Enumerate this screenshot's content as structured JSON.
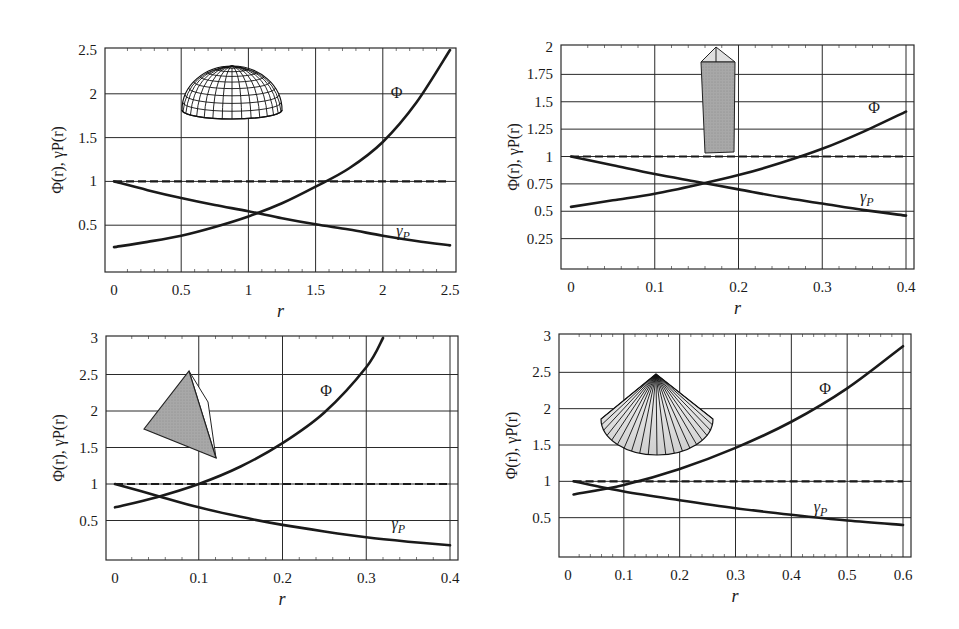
{
  "figure": {
    "width": 959,
    "height": 629
  },
  "chart_data": [
    {
      "type": "line",
      "panel": "top-left",
      "shape": "hemisphere-wireframe",
      "title": "",
      "xlabel": "r",
      "ylabel": "Φ(r), γP(r)",
      "xlim": [
        0,
        2.5
      ],
      "ylim": [
        0,
        2.5
      ],
      "xticks": [
        0,
        0.5,
        1,
        1.5,
        2,
        2.5
      ],
      "xtick_labels": [
        "0",
        "0.5",
        "1",
        "1.5",
        "2",
        "2.5"
      ],
      "yticks": [
        0.5,
        1,
        1.5,
        2,
        2.5
      ],
      "ytick_labels": [
        "0.5",
        "1",
        "1.5",
        "2",
        "2.5"
      ],
      "grid": true,
      "frame": {
        "left": 105,
        "top": 48,
        "right": 456,
        "bottom": 272,
        "x0px": 114,
        "x1px": 450
      },
      "series": [
        {
          "name": "Φ",
          "style": "solid",
          "x": [
            0,
            0.25,
            0.5,
            0.75,
            1.0,
            1.25,
            1.5,
            1.75,
            2.0,
            2.25,
            2.5
          ],
          "y": [
            0.25,
            0.31,
            0.38,
            0.48,
            0.6,
            0.75,
            0.94,
            1.15,
            1.45,
            1.9,
            2.5
          ]
        },
        {
          "name": "γP",
          "style": "solid",
          "x": [
            0,
            0.25,
            0.5,
            0.75,
            1.0,
            1.25,
            1.5,
            1.75,
            2.0,
            2.25,
            2.5
          ],
          "y": [
            1.0,
            0.9,
            0.81,
            0.73,
            0.66,
            0.58,
            0.51,
            0.45,
            0.38,
            0.32,
            0.27
          ]
        },
        {
          "name": "reference",
          "style": "dashed",
          "x": [
            0,
            2.5
          ],
          "y": [
            1.0,
            1.0
          ]
        }
      ],
      "annotations": [
        {
          "text": "Φ",
          "x": 2.06,
          "y": 1.95
        },
        {
          "text": "γP",
          "x": 2.1,
          "y": 0.38
        }
      ]
    },
    {
      "type": "line",
      "panel": "top-right",
      "shape": "prism-column",
      "title": "",
      "xlabel": "r",
      "ylabel": "Φ(r),  γP(r)",
      "xlim": [
        0,
        0.4
      ],
      "ylim": [
        0,
        2
      ],
      "xticks": [
        0,
        0.1,
        0.2,
        0.3,
        0.4
      ],
      "xtick_labels": [
        "0",
        "0.1",
        "0.2",
        "0.3",
        "0.4"
      ],
      "yticks": [
        0.25,
        0.5,
        0.75,
        1,
        1.25,
        1.5,
        1.75,
        2
      ],
      "ytick_labels": [
        "0.25",
        "0.5",
        "0.75",
        "1",
        "1.25",
        "1.5",
        "1.75",
        "2"
      ],
      "grid": true,
      "frame": {
        "left": 561,
        "top": 45,
        "right": 914,
        "bottom": 269,
        "x0px": 571,
        "x1px": 906
      },
      "series": [
        {
          "name": "Φ",
          "style": "solid",
          "x": [
            0,
            0.05,
            0.1,
            0.15,
            0.2,
            0.25,
            0.3,
            0.35,
            0.4
          ],
          "y": [
            0.54,
            0.6,
            0.66,
            0.74,
            0.83,
            0.94,
            1.07,
            1.23,
            1.41
          ]
        },
        {
          "name": "γP",
          "style": "solid",
          "x": [
            0,
            0.05,
            0.1,
            0.15,
            0.2,
            0.25,
            0.3,
            0.35,
            0.4
          ],
          "y": [
            1.0,
            0.92,
            0.84,
            0.77,
            0.7,
            0.63,
            0.57,
            0.51,
            0.46
          ]
        },
        {
          "name": "reference",
          "style": "dashed",
          "x": [
            0,
            0.4
          ],
          "y": [
            1.0,
            1.0
          ]
        }
      ],
      "annotations": [
        {
          "text": "Φ",
          "x": 0.355,
          "y": 1.4
        },
        {
          "text": "γP",
          "x": 0.345,
          "y": 0.58
        }
      ]
    },
    {
      "type": "line",
      "panel": "bottom-left",
      "shape": "tetrahedron",
      "title": "",
      "xlabel": "r",
      "ylabel": "Φ(r), γP(r)",
      "xlim": [
        0,
        0.4
      ],
      "ylim": [
        0,
        3
      ],
      "xticks": [
        0,
        0.1,
        0.2,
        0.3,
        0.4
      ],
      "xtick_labels": [
        "0",
        "0.1",
        "0.2",
        "0.3",
        "0.4"
      ],
      "yticks": [
        0.5,
        1,
        1.5,
        2,
        2.5,
        3
      ],
      "ytick_labels": [
        "0.5",
        "1",
        "1.5",
        "2",
        "2.5",
        "3"
      ],
      "grid": true,
      "frame": {
        "left": 106,
        "top": 336,
        "right": 458,
        "bottom": 560,
        "x0px": 115,
        "x1px": 450
      },
      "series": [
        {
          "name": "Φ",
          "style": "solid",
          "x": [
            0,
            0.05,
            0.1,
            0.15,
            0.2,
            0.25,
            0.3,
            0.32
          ],
          "y": [
            0.68,
            0.82,
            1.0,
            1.24,
            1.56,
            1.98,
            2.6,
            3.0
          ]
        },
        {
          "name": "γP",
          "style": "solid",
          "x": [
            0,
            0.05,
            0.1,
            0.15,
            0.2,
            0.25,
            0.3,
            0.35,
            0.4
          ],
          "y": [
            1.0,
            0.84,
            0.68,
            0.55,
            0.44,
            0.35,
            0.27,
            0.21,
            0.16
          ]
        },
        {
          "name": "reference",
          "style": "dashed",
          "x": [
            0,
            0.4
          ],
          "y": [
            1.0,
            1.0
          ]
        }
      ],
      "annotations": [
        {
          "text": "Φ",
          "x": 0.245,
          "y": 2.2
        },
        {
          "text": "γP",
          "x": 0.33,
          "y": 0.38
        }
      ]
    },
    {
      "type": "line",
      "panel": "bottom-right",
      "shape": "cone",
      "title": "",
      "xlabel": "r",
      "ylabel": "Φ(r), γP(r)",
      "xlim": [
        0,
        0.6
      ],
      "ylim": [
        0,
        3
      ],
      "xticks": [
        0,
        0.1,
        0.2,
        0.3,
        0.4,
        0.5,
        0.6
      ],
      "xtick_labels": [
        "0",
        "0.1",
        "0.2",
        "0.3",
        "0.4",
        "0.5",
        "0.6"
      ],
      "yticks": [
        0.5,
        1,
        1.5,
        2,
        2.5,
        3
      ],
      "ytick_labels": [
        "0.5",
        "1",
        "1.5",
        "2",
        "2.5",
        "3"
      ],
      "grid": true,
      "frame": {
        "left": 559,
        "top": 334,
        "right": 911,
        "bottom": 557,
        "x0px": 568,
        "x1px": 903
      },
      "series": [
        {
          "name": "Φ",
          "style": "solid",
          "x": [
            0.01,
            0.1,
            0.2,
            0.3,
            0.4,
            0.5,
            0.6
          ],
          "y": [
            0.82,
            0.95,
            1.17,
            1.46,
            1.82,
            2.28,
            2.86
          ]
        },
        {
          "name": "γP",
          "style": "solid",
          "x": [
            0.01,
            0.1,
            0.2,
            0.3,
            0.4,
            0.5,
            0.6
          ],
          "y": [
            1.0,
            0.86,
            0.74,
            0.63,
            0.54,
            0.46,
            0.4
          ]
        },
        {
          "name": "reference",
          "style": "dashed",
          "x": [
            0.01,
            0.6
          ],
          "y": [
            1.0,
            1.0
          ]
        }
      ],
      "annotations": [
        {
          "text": "Φ",
          "x": 0.45,
          "y": 2.2
        },
        {
          "text": "γP",
          "x": 0.44,
          "y": 0.58
        }
      ]
    }
  ]
}
